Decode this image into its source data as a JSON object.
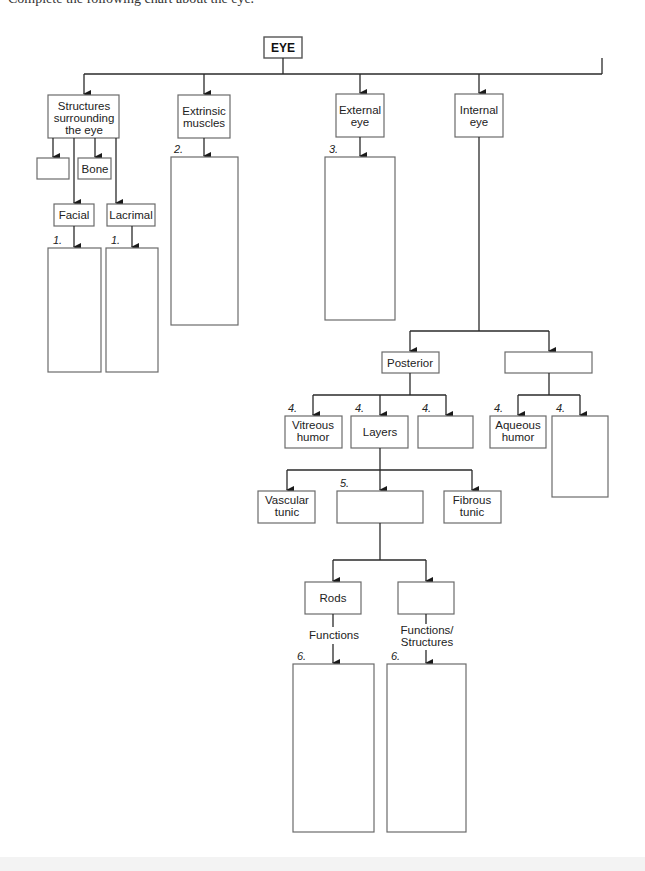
{
  "page": {
    "top_text_cutoff": "Complete the following chart about the eye."
  },
  "root": {
    "label": "EYE"
  },
  "level1": [
    {
      "id": "structures",
      "label_lines": [
        "Structures",
        "surrounding",
        "the eye"
      ]
    },
    {
      "id": "extrinsic",
      "label_lines": [
        "Extrinsic",
        "muscles"
      ]
    },
    {
      "id": "external",
      "label_lines": [
        "External",
        "eye"
      ]
    },
    {
      "id": "internal",
      "label_lines": [
        "Internal",
        "eye"
      ]
    }
  ],
  "structures_children": {
    "blank_box": "",
    "bone": "Bone",
    "facial": "Facial",
    "lacrimal": "Lacrimal"
  },
  "answer_numbers": {
    "facial": "1.",
    "lacrimal": "1.",
    "extrinsic": "2.",
    "external": "3.",
    "vitreous": "4.",
    "layers": "4.",
    "posterior_blank": "4.",
    "aqueous": "4.",
    "anterior_blank": "4.",
    "retina_blank": "5.",
    "rods": "6.",
    "cones": "6."
  },
  "internal_children": {
    "posterior": "Posterior",
    "anterior_blank": ""
  },
  "posterior_children": {
    "vitreous_lines": [
      "Vitreous",
      "humor"
    ],
    "layers": "Layers",
    "blank": ""
  },
  "anterior_children": {
    "aqueous_lines": [
      "Aqueous",
      "humor"
    ],
    "blank": ""
  },
  "layers_children": {
    "vascular_lines": [
      "Vascular",
      "tunic"
    ],
    "blank": "",
    "fibrous_lines": [
      "Fibrous",
      "tunic"
    ]
  },
  "retina_children": {
    "rods": "Rods",
    "cones_blank": "",
    "rods_connector": "Functions",
    "cones_connector_lines": [
      "Functions/",
      "Structures"
    ]
  }
}
